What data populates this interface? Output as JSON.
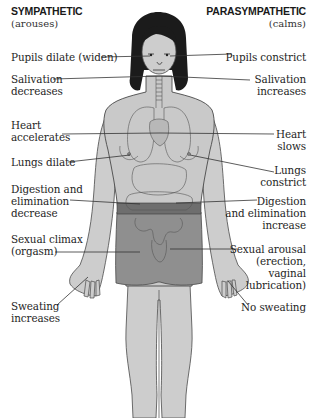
{
  "headers": {
    "left": {
      "title": "SYMPATHETIC",
      "subtitle": "(arouses)"
    },
    "right": {
      "title": "PARASYMPATHETIC",
      "subtitle": "(calms)"
    }
  },
  "sympathetic_labels": [
    {
      "id": "pupils",
      "text": "Pupils dilate (widen)"
    },
    {
      "id": "salivation",
      "text": "Salivation\ndecreases"
    },
    {
      "id": "heart",
      "text": "Heart\naccelerates"
    },
    {
      "id": "lungs",
      "text": "Lungs dilate"
    },
    {
      "id": "digestion",
      "text": "Digestion and\nelimination\ndecrease"
    },
    {
      "id": "sexual",
      "text": "Sexual climax\n(orgasm)"
    },
    {
      "id": "sweating",
      "text": "Sweating\nincreases"
    }
  ],
  "parasympathetic_labels": [
    {
      "id": "pupils",
      "text": "Pupils constrict"
    },
    {
      "id": "salivation",
      "text": "Salivation\nincreases"
    },
    {
      "id": "heart",
      "text": "Heart\nslows"
    },
    {
      "id": "lungs",
      "text": "Lungs\nconstrict"
    },
    {
      "id": "digestion",
      "text": "Digestion\nand elimination\nincrease"
    },
    {
      "id": "sexual",
      "text": "Sexual arousal\n(erection,\nvaginal\nlubrication)"
    },
    {
      "id": "sweating",
      "text": "No sweating"
    }
  ],
  "colors": {
    "skin": "#c9c9c9",
    "skin_outline": "#4a4a4a",
    "hair": "#1b1b1b",
    "shorts": "#8f8f8f",
    "band": "#6e6e6e",
    "organs": "#b3b3b3",
    "leader_line": "#333333"
  },
  "figure": {
    "icon": "human-body-figure"
  }
}
